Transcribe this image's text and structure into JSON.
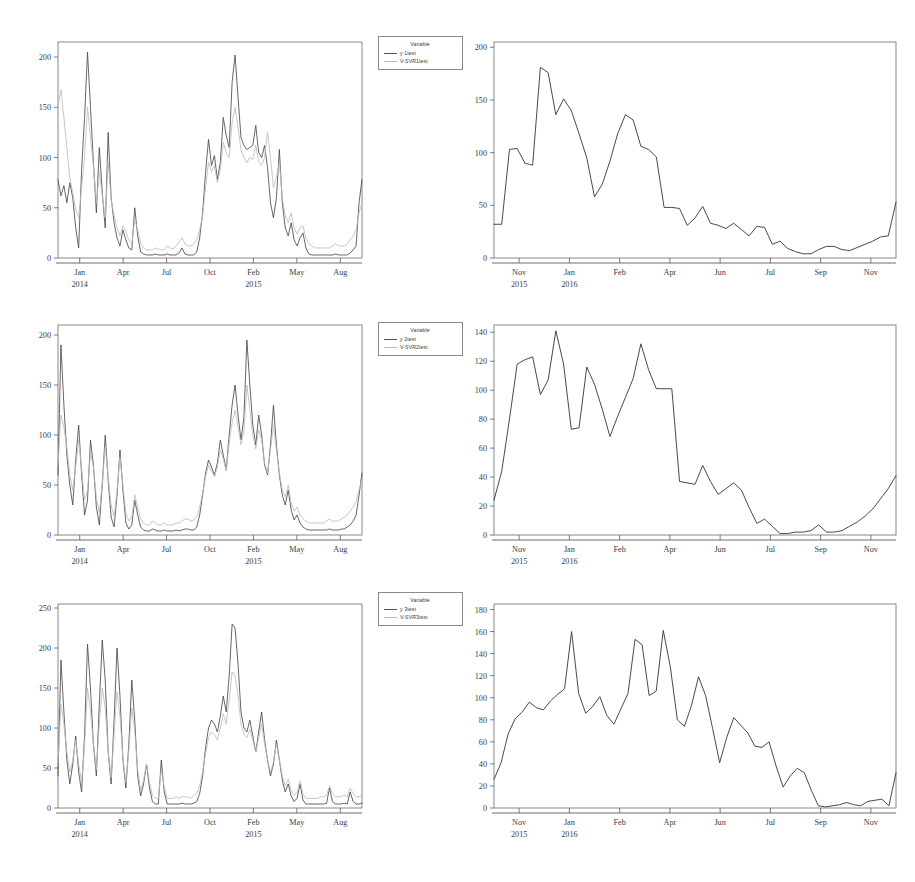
{
  "figure": {
    "background": "#ffffff",
    "ink_color": "#4a4a4a",
    "pred_color": "#bdbdbd",
    "panel_count": 6
  },
  "legends": [
    {
      "title": "Variable",
      "entries": [
        {
          "label": "y 1test",
          "style": "solid-dark"
        },
        {
          "label": "V-SVR1test",
          "style": "solid-light"
        }
      ]
    },
    {
      "title": "Variable",
      "entries": [
        {
          "label": "y 2test",
          "style": "solid-dark"
        },
        {
          "label": "V-SVR2test",
          "style": "solid-light"
        }
      ]
    },
    {
      "title": "Variable",
      "entries": [
        {
          "label": "y 3test",
          "style": "solid-dark"
        },
        {
          "label": "V-SVR3test",
          "style": "solid-light"
        }
      ]
    }
  ],
  "chart_data": [
    {
      "id": "panel-top-left",
      "type": "line",
      "title": "",
      "xlabel": "",
      "ylabel": "",
      "ylim": [
        0,
        215
      ],
      "yticks": [
        0,
        50,
        100,
        150,
        200
      ],
      "xtick_labels": [
        "Jan",
        "Apr",
        "Jul",
        "Oct",
        "Feb",
        "May",
        "Aug"
      ],
      "xtick_years": [
        {
          "label": "2014",
          "under": "Jan"
        },
        {
          "label": "2015",
          "under": "Feb"
        }
      ],
      "grid": false,
      "legend_position": "right-outside",
      "series": [
        {
          "name": "y 1test",
          "style": "solid-dark",
          "values": [
            78,
            62,
            72,
            55,
            75,
            60,
            30,
            10,
            88,
            140,
            205,
            150,
            95,
            45,
            110,
            65,
            30,
            125,
            60,
            35,
            20,
            12,
            28,
            18,
            10,
            8,
            50,
            22,
            6,
            4,
            3,
            3,
            3,
            4,
            3,
            3,
            3,
            4,
            3,
            3,
            3,
            5,
            10,
            4,
            3,
            3,
            3,
            6,
            20,
            45,
            85,
            118,
            92,
            102,
            78,
            95,
            140,
            122,
            110,
            175,
            202,
            160,
            120,
            112,
            108,
            110,
            112,
            132,
            105,
            100,
            112,
            90,
            55,
            40,
            60,
            108,
            55,
            30,
            22,
            35,
            18,
            12,
            20,
            25,
            10,
            4,
            3,
            3,
            3,
            3,
            3,
            3,
            3,
            3,
            4,
            3,
            3,
            3,
            3,
            5,
            8,
            12,
            55,
            78
          ]
        },
        {
          "name": "V-SVR1test",
          "style": "solid-light",
          "values": [
            150,
            168,
            140,
            110,
            80,
            65,
            48,
            40,
            70,
            100,
            150,
            120,
            92,
            55,
            85,
            62,
            40,
            95,
            58,
            42,
            30,
            22,
            32,
            26,
            18,
            14,
            38,
            28,
            14,
            10,
            8,
            8,
            8,
            10,
            9,
            8,
            8,
            12,
            10,
            9,
            12,
            16,
            20,
            14,
            12,
            12,
            14,
            18,
            28,
            42,
            70,
            95,
            86,
            92,
            75,
            88,
            115,
            105,
            100,
            135,
            150,
            130,
            108,
            100,
            95,
            100,
            98,
            112,
            96,
            92,
            100,
            125,
            100,
            70,
            80,
            95,
            60,
            42,
            35,
            45,
            30,
            24,
            30,
            32,
            20,
            14,
            12,
            10,
            10,
            10,
            10,
            10,
            10,
            12,
            14,
            12,
            12,
            12,
            14,
            18,
            22,
            28,
            45,
            55
          ]
        }
      ]
    },
    {
      "id": "panel-top-right",
      "type": "line",
      "title": "",
      "xlabel": "",
      "ylabel": "",
      "ylim": [
        0,
        205
      ],
      "yticks": [
        0,
        50,
        100,
        150,
        200
      ],
      "xtick_labels": [
        "Nov",
        "Jan",
        "Feb",
        "Apr",
        "Jun",
        "Jul",
        "Sep",
        "Nov"
      ],
      "xtick_years": [
        {
          "label": "2015",
          "under": "Nov"
        },
        {
          "label": "2016",
          "under": "Jan"
        }
      ],
      "grid": false,
      "legend_position": "none",
      "series": [
        {
          "name": "y 1test",
          "style": "solid-dark",
          "values": [
            32,
            32,
            103,
            104,
            90,
            88,
            181,
            176,
            136,
            151,
            140,
            118,
            95,
            58,
            70,
            92,
            118,
            136,
            131,
            106,
            103,
            96,
            48,
            48,
            47,
            31,
            38,
            49,
            33,
            31,
            28,
            33,
            27,
            21,
            30,
            29,
            13,
            16,
            9,
            6,
            4,
            4,
            8,
            11,
            11,
            8,
            7,
            10,
            13,
            16,
            20,
            21,
            53
          ]
        }
      ]
    },
    {
      "id": "panel-mid-left",
      "type": "line",
      "title": "",
      "xlabel": "",
      "ylabel": "",
      "ylim": [
        0,
        210
      ],
      "yticks": [
        0,
        50,
        100,
        150,
        200
      ],
      "xtick_labels": [
        "Jan",
        "Apr",
        "Jul",
        "Oct",
        "Feb",
        "May",
        "Aug"
      ],
      "xtick_years": [
        {
          "label": "2014",
          "under": "Jan"
        },
        {
          "label": "2015",
          "under": "Feb"
        }
      ],
      "grid": false,
      "legend_position": "right-outside",
      "series": [
        {
          "name": "y 2test",
          "style": "solid-dark",
          "values": [
            60,
            190,
            130,
            80,
            50,
            30,
            75,
            110,
            60,
            20,
            35,
            95,
            70,
            28,
            10,
            50,
            100,
            55,
            18,
            8,
            40,
            85,
            45,
            12,
            6,
            10,
            35,
            20,
            8,
            5,
            4,
            4,
            6,
            5,
            4,
            4,
            5,
            4,
            4,
            4,
            5,
            4,
            5,
            6,
            6,
            5,
            5,
            8,
            20,
            40,
            62,
            75,
            68,
            60,
            72,
            95,
            80,
            65,
            100,
            130,
            150,
            120,
            95,
            118,
            195,
            150,
            110,
            90,
            120,
            100,
            70,
            60,
            90,
            130,
            90,
            60,
            40,
            30,
            45,
            25,
            15,
            20,
            12,
            8,
            6,
            5,
            5,
            5,
            5,
            5,
            5,
            5,
            6,
            5,
            5,
            5,
            6,
            6,
            8,
            10,
            14,
            20,
            40,
            62
          ]
        },
        {
          "name": "V-SVR2test",
          "style": "solid-light",
          "values": [
            70,
            120,
            108,
            88,
            60,
            45,
            68,
            95,
            66,
            35,
            45,
            82,
            68,
            38,
            22,
            52,
            88,
            58,
            30,
            18,
            45,
            78,
            50,
            22,
            14,
            18,
            40,
            28,
            16,
            12,
            10,
            10,
            14,
            12,
            10,
            10,
            12,
            10,
            10,
            10,
            12,
            12,
            14,
            16,
            16,
            14,
            15,
            18,
            28,
            42,
            58,
            70,
            64,
            58,
            68,
            85,
            76,
            64,
            92,
            112,
            125,
            108,
            90,
            105,
            150,
            126,
            100,
            86,
            105,
            95,
            72,
            62,
            85,
            110,
            85,
            62,
            45,
            38,
            50,
            32,
            24,
            28,
            20,
            16,
            14,
            12,
            12,
            12,
            12,
            12,
            12,
            14,
            16,
            14,
            14,
            14,
            16,
            18,
            20,
            24,
            28,
            34,
            45,
            55
          ]
        }
      ]
    },
    {
      "id": "panel-mid-right",
      "type": "line",
      "title": "",
      "xlabel": "",
      "ylabel": "",
      "ylim": [
        0,
        145
      ],
      "yticks": [
        0,
        20,
        40,
        60,
        80,
        100,
        120,
        140
      ],
      "xtick_labels": [
        "Nov",
        "Jan",
        "Feb",
        "Apr",
        "Jun",
        "Jul",
        "Sep",
        "Nov"
      ],
      "xtick_years": [
        {
          "label": "2015",
          "under": "Nov"
        },
        {
          "label": "2016",
          "under": "Jan"
        }
      ],
      "grid": false,
      "legend_position": "none",
      "series": [
        {
          "name": "y 2test",
          "style": "solid-dark",
          "values": [
            24,
            44,
            80,
            118,
            121,
            123,
            97,
            107,
            141,
            118,
            73,
            74,
            116,
            104,
            87,
            68,
            82,
            95,
            108,
            132,
            114,
            101,
            101,
            101,
            37,
            36,
            35,
            48,
            37,
            28,
            32,
            36,
            31,
            19,
            8,
            11,
            6,
            1,
            1,
            2,
            2,
            3,
            7,
            2,
            2,
            3,
            6,
            9,
            13,
            18,
            25,
            32,
            41
          ]
        }
      ]
    },
    {
      "id": "panel-bottom-left",
      "type": "line",
      "title": "",
      "xlabel": "",
      "ylabel": "",
      "ylim": [
        0,
        255
      ],
      "yticks": [
        0,
        50,
        100,
        150,
        200,
        250
      ],
      "xtick_labels": [
        "Jan",
        "Apr",
        "Jul",
        "Oct",
        "Feb",
        "May",
        "Aug"
      ],
      "xtick_years": [
        {
          "label": "2014",
          "under": "Jan"
        },
        {
          "label": "2015",
          "under": "2015"
        }
      ],
      "grid": false,
      "legend_position": "right-outside",
      "series": [
        {
          "name": "y 3test",
          "style": "solid-dark",
          "values": [
            40,
            185,
            120,
            60,
            30,
            55,
            90,
            45,
            20,
            90,
            205,
            150,
            80,
            40,
            130,
            210,
            160,
            70,
            30,
            110,
            200,
            140,
            60,
            25,
            80,
            160,
            110,
            40,
            15,
            30,
            55,
            25,
            8,
            5,
            5,
            60,
            20,
            5,
            5,
            5,
            5,
            5,
            6,
            5,
            5,
            5,
            6,
            8,
            18,
            40,
            75,
            100,
            110,
            105,
            95,
            115,
            140,
            120,
            165,
            230,
            225,
            180,
            120,
            100,
            95,
            110,
            90,
            70,
            95,
            120,
            85,
            60,
            40,
            55,
            85,
            60,
            35,
            20,
            30,
            15,
            8,
            12,
            30,
            10,
            5,
            5,
            5,
            5,
            5,
            5,
            5,
            6,
            25,
            8,
            5,
            5,
            5,
            6,
            5,
            20,
            8,
            5,
            5,
            6
          ]
        },
        {
          "name": "V-SVR3test",
          "style": "solid-light",
          "values": [
            55,
            130,
            105,
            70,
            45,
            60,
            85,
            55,
            32,
            78,
            150,
            120,
            80,
            48,
            105,
            150,
            125,
            70,
            38,
            92,
            145,
            115,
            62,
            32,
            72,
            125,
            95,
            48,
            22,
            35,
            55,
            32,
            16,
            12,
            12,
            48,
            26,
            12,
            12,
            12,
            14,
            12,
            14,
            14,
            14,
            12,
            16,
            18,
            28,
            45,
            68,
            88,
            95,
            92,
            85,
            100,
            118,
            105,
            135,
            170,
            165,
            140,
            105,
            92,
            88,
            98,
            85,
            70,
            88,
            105,
            80,
            60,
            45,
            58,
            80,
            60,
            40,
            28,
            36,
            22,
            16,
            20,
            34,
            18,
            12,
            12,
            12,
            12,
            12,
            14,
            14,
            16,
            28,
            18,
            14,
            14,
            14,
            16,
            14,
            25,
            18,
            14,
            14,
            16
          ]
        }
      ]
    },
    {
      "id": "panel-bottom-right",
      "type": "line",
      "title": "",
      "xlabel": "",
      "ylabel": "",
      "ylim": [
        0,
        185
      ],
      "yticks": [
        0,
        20,
        40,
        60,
        80,
        100,
        120,
        140,
        160,
        180
      ],
      "xtick_labels": [
        "Nov",
        "Jan",
        "Feb",
        "Apr",
        "Jun",
        "Jul",
        "Sep",
        "Nov"
      ],
      "xtick_years": [
        {
          "label": "2015",
          "under": "Nov"
        },
        {
          "label": "2016",
          "under": "Jan"
        }
      ],
      "grid": false,
      "legend_position": "none",
      "series": [
        {
          "name": "y 3test",
          "style": "solid-dark",
          "values": [
            26,
            41,
            67,
            81,
            87,
            96,
            91,
            89,
            97,
            103,
            108,
            160,
            104,
            86,
            92,
            101,
            84,
            76,
            90,
            104,
            153,
            148,
            102,
            106,
            161,
            128,
            80,
            74,
            93,
            119,
            102,
            72,
            41,
            64,
            82,
            75,
            68,
            56,
            55,
            60,
            38,
            19,
            29,
            36,
            32,
            16,
            2,
            1,
            2,
            3,
            5,
            3,
            2,
            6,
            7,
            8,
            2,
            32
          ]
        }
      ]
    }
  ]
}
